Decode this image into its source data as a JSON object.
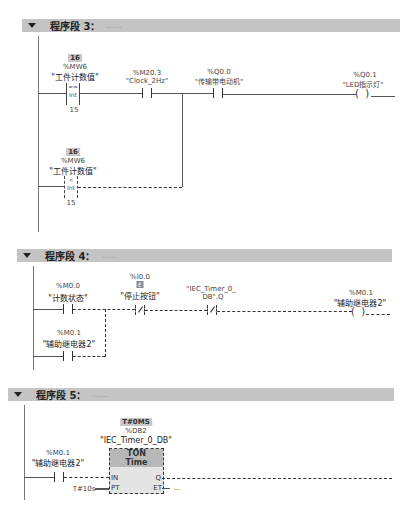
{
  "networks": [
    {
      "id": 3,
      "title": "程序段 3：",
      "comment": "......",
      "elements": {
        "cmp_eq": {
          "value": "16",
          "address": "%MW6",
          "name": "\"工件计数值\"",
          "op": "==",
          "type": "Int",
          "operand2": "15"
        },
        "clock": {
          "address": "%M20.3",
          "name": "\"Clock_2Hz\""
        },
        "motor": {
          "address": "%Q0.0",
          "name": "\"传输带电动机\""
        },
        "led_coil": {
          "address": "%Q0.1",
          "name": "\"LED指示灯\""
        },
        "cmp_lt": {
          "value": "16",
          "address": "%MW6",
          "name": "\"工件计数值\"",
          "op": "<",
          "type": "Int",
          "operand2": "15"
        }
      }
    },
    {
      "id": 4,
      "title": "程序段 4：",
      "comment": "......",
      "elements": {
        "count_state": {
          "address": "%M0.0",
          "name": "\"计数状态\""
        },
        "stop_btn": {
          "address": "%I0.0",
          "badge": "E",
          "name": "\"停止按钮\""
        },
        "timer_q": {
          "name_line1": "\"IEC_Timer_0_",
          "name_line2": "DB\".Q"
        },
        "relay_coil": {
          "address": "%M0.1",
          "name": "\"辅助继电器2\""
        },
        "relay_parallel": {
          "address": "%M0.1",
          "name": "\"辅助继电器2\""
        }
      }
    },
    {
      "id": 5,
      "title": "程序段 5：",
      "comment": "......",
      "elements": {
        "relay": {
          "address": "%M0.1",
          "name": "\"辅助继电器2\""
        },
        "timer": {
          "status": "T#0MS",
          "db": "%DB2",
          "instance": "\"IEC_Timer_0_DB\"",
          "type": "TON",
          "subtype": "Time",
          "pin_in": "IN",
          "pin_pt": "PT",
          "pin_q": "Q",
          "pin_et": "ET",
          "pt_value": "T#10s",
          "et_value": "..."
        }
      }
    }
  ]
}
